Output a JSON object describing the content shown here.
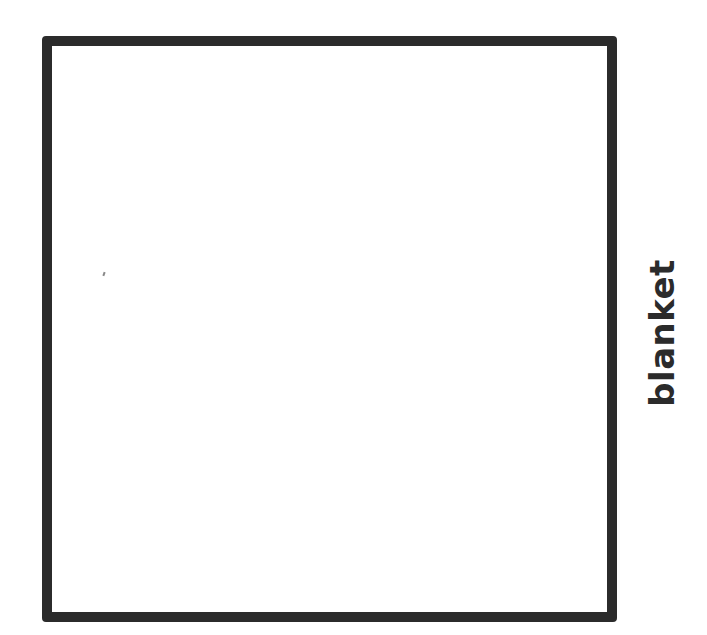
{
  "diagram": {
    "label": "blanket",
    "shape": "square",
    "stroke_color": "#2b2b2b",
    "background_color": "#ffffff"
  }
}
